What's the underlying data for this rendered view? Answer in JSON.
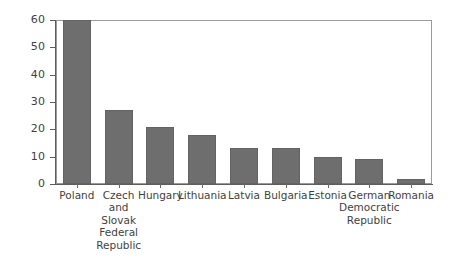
{
  "chart_data": {
    "type": "bar",
    "title": "",
    "subtitle": "",
    "xlabel": "",
    "ylabel": "",
    "ylim": [
      0,
      60
    ],
    "yticks": [
      0,
      10,
      20,
      30,
      40,
      50,
      60
    ],
    "grid": false,
    "legend": null,
    "bar_color": "#6e6e6e",
    "background_color": "#ffffff",
    "axis_color": "#5d5d5d",
    "categories": [
      "Poland",
      "Czech and Slovak Federal Republic",
      "Hungary",
      "Lithuania",
      "Latvia",
      "Bulgaria",
      "Estonia",
      "German Democratic Republic",
      "Romania"
    ],
    "category_label_lines": [
      [
        "Poland"
      ],
      [
        "Czech",
        "and",
        "Slovak",
        "Federal",
        "Republic"
      ],
      [
        "Hungary"
      ],
      [
        "Lithuania"
      ],
      [
        "Latvia"
      ],
      [
        "Bulgaria"
      ],
      [
        "Estonia"
      ],
      [
        "German",
        "Democratic",
        "Republic"
      ],
      [
        "Romania"
      ]
    ],
    "values": [
      60,
      27,
      21,
      18,
      13,
      13,
      10,
      9,
      2
    ]
  }
}
